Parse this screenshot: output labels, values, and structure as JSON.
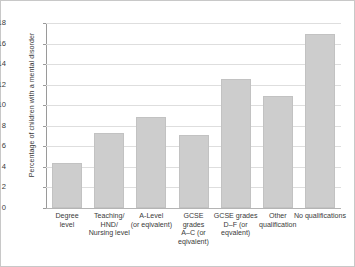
{
  "chart_data": {
    "type": "bar",
    "title": "",
    "subtitle": "",
    "xlabel": "",
    "ylabel": "Percentage of children with a mental disorder",
    "ylim": [
      0,
      18
    ],
    "ytick_step": 2,
    "yticks": [
      "0",
      "2",
      "4",
      "6",
      "8",
      "10",
      "12",
      "14",
      "16",
      "18"
    ],
    "grid": "horizontal",
    "legend": "none",
    "categories": [
      "Degree level",
      "Teaching/ HND/ Nursing level",
      "A-Level (or eqivalent)",
      "GCSE grades A–C (or eqivalent)",
      "GCSE grades D–F (or eqvalent)",
      "Other qualification",
      "No qualifications"
    ],
    "category_lines": [
      [
        "Degree",
        "level"
      ],
      [
        "Teaching/",
        "HND/",
        "Nursing level"
      ],
      [
        "A-Level",
        "(or eqivalent)"
      ],
      [
        "GCSE",
        "grades",
        "A–C (or",
        "eqivalent)"
      ],
      [
        "GCSE grades",
        "D–F (or",
        "eqvalent)"
      ],
      [
        "Other",
        "qualification"
      ],
      [
        "No qualifications"
      ]
    ],
    "values": [
      4.4,
      7.3,
      8.9,
      7.1,
      12.6,
      10.9,
      16.9
    ],
    "series": [
      {
        "name": "Percentage of children with a mental disorder",
        "values": [
          4.4,
          7.3,
          8.9,
          7.1,
          12.6,
          10.9,
          16.9
        ]
      }
    ],
    "colors": {
      "bar_fill": "#cdcdcd",
      "bar_border": "#c2c2c2",
      "gridline": "#dedede",
      "axis": "#9a9a9a",
      "frame": "#c8c8c8",
      "text": "#3a3a3a",
      "background": "#ffffff"
    }
  }
}
